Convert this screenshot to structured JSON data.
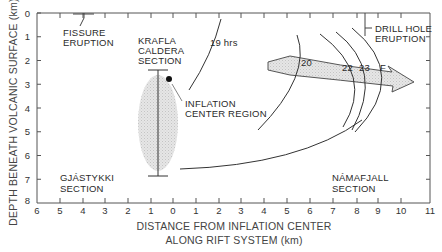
{
  "diagram": {
    "y_axis": {
      "title": "DEPTH BENEATH VOLCANIC SURFACE (km)",
      "ticks": [
        "0",
        "1",
        "2",
        "3",
        "4",
        "5",
        "6",
        "7",
        "8"
      ]
    },
    "x_axis": {
      "title_line1": "DISTANCE FROM INFLATION CENTER",
      "title_line2": "ALONG RIFT SYSTEM (km)",
      "ticks": [
        "6",
        "5",
        "4",
        "3",
        "2",
        "1",
        "0",
        "1",
        "2",
        "3",
        "4",
        "5",
        "6",
        "7",
        "8",
        "9",
        "10",
        "11"
      ]
    },
    "labels": {
      "fissure_eruption_1": "FISSURE",
      "fissure_eruption_2": "ERUPTION",
      "krafla_1": "KRAFLA",
      "krafla_2": "CALDERA",
      "krafla_3": "SECTION",
      "hrs19": "19 hrs",
      "inflation_1": "INFLATION",
      "inflation_2": "CENTER REGION",
      "drill_1": "DRILL HOLE",
      "drill_2": "ERUPTION",
      "gjastykki_1": "GJÁSTYKKI",
      "gjastykki_2": "SECTION",
      "namafjall_1": "NÁMAFJALL",
      "namafjall_2": "SECTION"
    },
    "curve_labels": [
      "20",
      "22",
      "23",
      "F"
    ],
    "colors": {
      "line": "#2a2a2a",
      "fill_shade": "#d9d9d9",
      "background": "#ffffff"
    }
  }
}
